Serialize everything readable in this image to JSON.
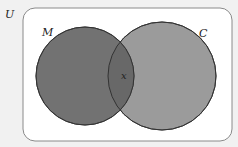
{
  "diagram": {
    "type": "venn",
    "universe_label": "U",
    "sets": [
      {
        "label": "M",
        "fill": "#707070"
      },
      {
        "label": "C",
        "fill": "#9a9a9a"
      }
    ],
    "intersection_label": "x",
    "intersection_fill": "#656565",
    "background_fill": "#ffffff",
    "page_fill": "#f1f1f1"
  }
}
